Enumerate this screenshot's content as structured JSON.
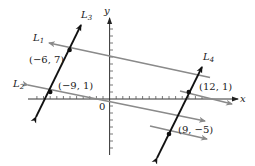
{
  "axes": {
    "x_label": "x",
    "y_label": "y",
    "origin_label": "0",
    "origin_px": [
      109.6,
      99
    ],
    "px_per_unit_x": 6.6,
    "px_per_unit_y": 7
  },
  "lines": [
    {
      "name": "L",
      "sub": "1",
      "color": "#8a8a8a",
      "passes": [
        -6,
        7
      ],
      "slope": -0.3333
    },
    {
      "name": "L",
      "sub": "2",
      "color": "#8a8a8a",
      "passes": [
        -9,
        1
      ],
      "slope": -0.3333
    },
    {
      "name": "L",
      "sub": "3",
      "color": "#111111",
      "passes": [
        -6,
        7
      ],
      "slope": 2
    },
    {
      "name": "L",
      "sub": "4",
      "color": "#111111",
      "passes": [
        12,
        1
      ],
      "slope": 2
    }
  ],
  "points": [
    {
      "label": "(−6, 7)",
      "x": -6,
      "y": 7
    },
    {
      "label": "(−9, 1)",
      "x": -9,
      "y": 1
    },
    {
      "label": "(12, 1)",
      "x": 12,
      "y": 1
    },
    {
      "label": "(9, −5)",
      "x": 9,
      "y": -5
    }
  ]
}
